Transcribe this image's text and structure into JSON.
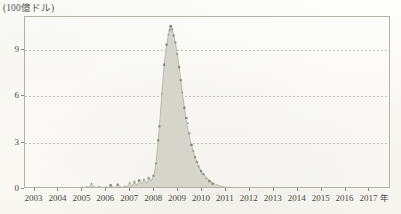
{
  "chart_data": {
    "type": "area",
    "title": "",
    "subtitle": "",
    "unit_label": "(100億ドル)",
    "ylabel": "",
    "xlabel": "",
    "x_axis_suffix": "年",
    "ylim": [
      0,
      11.1
    ],
    "yticks": [
      0,
      3,
      6,
      9
    ],
    "ytick_labels": [
      "0",
      "3",
      "6",
      "9"
    ],
    "xlim": [
      2002.6,
      2017.9
    ],
    "xticks": [
      2003,
      2004,
      2005,
      2006,
      2007,
      2008,
      2009,
      2010,
      2011,
      2012,
      2013,
      2014,
      2015,
      2016,
      2017
    ],
    "xtick_labels": [
      "2003",
      "2004",
      "2005",
      "2006",
      "2007",
      "2008",
      "2009",
      "2010",
      "2011",
      "2012",
      "2013",
      "2014",
      "2015",
      "2016",
      "2017"
    ],
    "grid": "horizontal-dotted",
    "legend": "none",
    "series": [
      {
        "name": "series-1",
        "color": "#d6d5cb",
        "edge_color": "#6f6d63",
        "x": [
          2002.7,
          2002.8,
          2002.9,
          2003.0,
          2003.1,
          2003.2,
          2003.3,
          2003.4,
          2003.5,
          2003.6,
          2003.7,
          2003.8,
          2003.9,
          2004.0,
          2004.1,
          2004.2,
          2004.3,
          2004.4,
          2004.5,
          2004.6,
          2004.7,
          2004.8,
          2004.9,
          2005.0,
          2005.1,
          2005.2,
          2005.3,
          2005.4,
          2005.5,
          2005.6,
          2005.7,
          2005.8,
          2005.9,
          2006.0,
          2006.1,
          2006.2,
          2006.3,
          2006.4,
          2006.5,
          2006.6,
          2006.7,
          2006.8,
          2006.9,
          2007.0,
          2007.1,
          2007.2,
          2007.3,
          2007.4,
          2007.5,
          2007.6,
          2007.7,
          2007.8,
          2007.9,
          2008.0,
          2008.05,
          2008.1,
          2008.15,
          2008.2,
          2008.25,
          2008.3,
          2008.35,
          2008.4,
          2008.45,
          2008.5,
          2008.55,
          2008.6,
          2008.65,
          2008.7,
          2008.75,
          2008.8,
          2008.85,
          2008.9,
          2008.95,
          2009.0,
          2009.05,
          2009.1,
          2009.15,
          2009.2,
          2009.25,
          2009.3,
          2009.35,
          2009.4,
          2009.45,
          2009.5,
          2009.55,
          2009.6,
          2009.65,
          2009.7,
          2009.75,
          2009.8,
          2009.85,
          2009.9,
          2009.95,
          2010.0,
          2010.1,
          2010.2,
          2010.3,
          2010.4,
          2010.5,
          2010.6,
          2010.8,
          2011.0,
          2011.5,
          2012.0,
          2012.5,
          2013.0,
          2013.5,
          2014.0,
          2014.5,
          2015.0,
          2015.5,
          2016.0,
          2016.5,
          2017.0,
          2017.5,
          2017.85
        ],
        "y": [
          0.0,
          0.0,
          0.02,
          0.0,
          0.03,
          0.01,
          0.0,
          0.02,
          0.0,
          0.01,
          0.03,
          0.0,
          0.02,
          0.01,
          0.0,
          0.03,
          0.02,
          0.0,
          0.05,
          0.02,
          0.01,
          0.04,
          0.02,
          0.06,
          0.03,
          0.1,
          0.05,
          0.3,
          0.08,
          0.04,
          0.12,
          0.06,
          0.03,
          0.09,
          0.05,
          0.18,
          0.07,
          0.04,
          0.22,
          0.09,
          0.05,
          0.14,
          0.08,
          0.35,
          0.12,
          0.4,
          0.18,
          0.5,
          0.25,
          0.55,
          0.3,
          0.65,
          0.45,
          0.8,
          1.1,
          1.6,
          2.3,
          3.1,
          4.0,
          5.0,
          6.1,
          7.1,
          8.0,
          8.7,
          9.3,
          9.7,
          10.1,
          10.45,
          10.6,
          10.3,
          9.9,
          9.6,
          9.2,
          8.7,
          8.2,
          7.6,
          7.0,
          6.4,
          5.8,
          5.2,
          4.7,
          4.2,
          3.8,
          3.4,
          3.1,
          2.8,
          2.5,
          2.25,
          2.0,
          1.8,
          1.6,
          1.4,
          1.25,
          1.1,
          0.9,
          0.72,
          0.58,
          0.45,
          0.34,
          0.25,
          0.14,
          0.07,
          0.03,
          0.02,
          0.01,
          0.02,
          0.01,
          0.01,
          0.02,
          0.01,
          0.01,
          0.02,
          0.01,
          0.01,
          0.01,
          0.0
        ],
        "markers_x": [
          2005.4,
          2006.2,
          2006.5,
          2007.0,
          2007.2,
          2007.4,
          2007.6,
          2007.8,
          2008.0,
          2008.1,
          2008.2,
          2008.25,
          2008.35,
          2008.45,
          2008.55,
          2008.62,
          2008.68,
          2008.72,
          2008.78,
          2008.85,
          2008.92,
          2009.0,
          2009.08,
          2009.15,
          2009.22,
          2009.3,
          2009.38,
          2009.45,
          2009.52,
          2009.6,
          2009.68,
          2009.75,
          2009.82,
          2009.9,
          2010.0,
          2010.1,
          2010.22,
          2010.35,
          2010.48
        ],
        "markers_y": [
          0.3,
          0.18,
          0.22,
          0.35,
          0.4,
          0.5,
          0.55,
          0.65,
          0.8,
          1.6,
          3.1,
          4.0,
          6.1,
          8.0,
          9.3,
          9.95,
          10.25,
          10.5,
          10.3,
          9.9,
          9.45,
          8.7,
          7.85,
          7.0,
          6.2,
          5.2,
          4.55,
          4.2,
          3.55,
          2.8,
          2.4,
          2.0,
          1.7,
          1.4,
          1.1,
          0.9,
          0.62,
          0.45,
          0.28
        ]
      }
    ]
  }
}
